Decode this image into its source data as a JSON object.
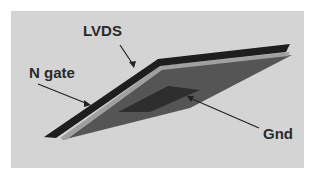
{
  "figure": {
    "background_color": "#d4d4d4",
    "labels": {
      "lvds": "LVDS",
      "n_gate": "N gate",
      "gnd": "Gnd"
    },
    "layers": [
      {
        "name": "LVDS",
        "color": "#222222"
      },
      {
        "name": "N gate",
        "color": "#9a9a9a"
      },
      {
        "name": "Gnd",
        "color": "#555555"
      }
    ]
  }
}
